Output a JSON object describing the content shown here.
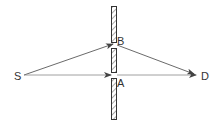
{
  "diagram": {
    "labels": {
      "source": "S",
      "detector": "D",
      "slit_a": "A",
      "slit_b": "B"
    },
    "colors": {
      "line": "#444444",
      "barrier": "#333333",
      "hatch": "#555555",
      "background": "#ffffff"
    }
  }
}
